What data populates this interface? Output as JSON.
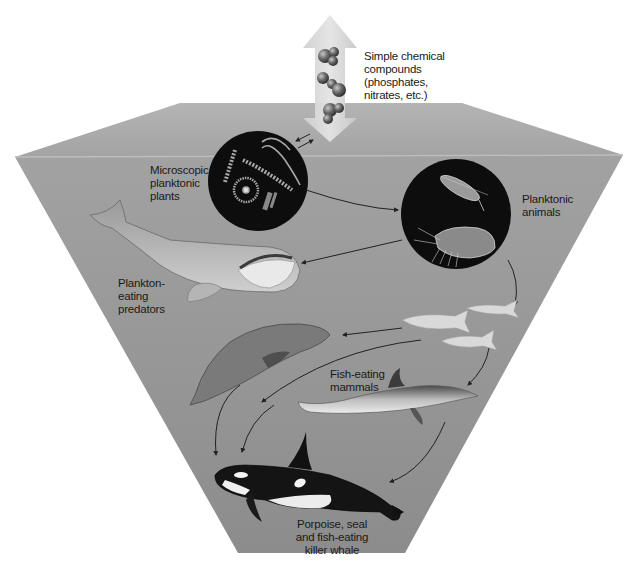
{
  "diagram": {
    "colors": {
      "background": "#ffffff",
      "surface_top": "#a9a9a9",
      "water_face": "#9a9a9a",
      "water_face_dark": "#8a8a8a",
      "circle_fill": "#0d0d0d",
      "arrow_line": "#222222",
      "up_arrow": "#d6d6d6",
      "label_text": "#1a1a1a"
    },
    "labels": {
      "chemicals": [
        "Simple chemical",
        "compounds",
        "(phosphates,",
        "nitrates, etc.)"
      ],
      "plants": [
        "Microscopic",
        "planktonic",
        "plants"
      ],
      "animals": [
        "Planktonic",
        "animals"
      ],
      "predators": [
        "Plankton-",
        "eating",
        "predators"
      ],
      "mammals": [
        "Fish-eating mammals"
      ],
      "killer_whale": [
        "Porpoise, seal",
        "and fish-eating",
        "killer whale"
      ]
    },
    "nodes": [
      {
        "id": "chemicals",
        "name": "Simple chemical compounds (phosphates, nitrates, etc.)"
      },
      {
        "id": "plants",
        "name": "Microscopic planktonic plants"
      },
      {
        "id": "animals",
        "name": "Planktonic animals"
      },
      {
        "id": "baleen_whale",
        "name": "Plankton-eating predators"
      },
      {
        "id": "fish",
        "name": "Fish"
      },
      {
        "id": "seal",
        "name": "Seal"
      },
      {
        "id": "dolphin",
        "name": "Fish-eating mammals"
      },
      {
        "id": "orca",
        "name": "Porpoise, seal and fish-eating killer whale"
      }
    ],
    "edges": [
      {
        "from": "chemicals",
        "to": "plants"
      },
      {
        "from": "plants",
        "to": "animals"
      },
      {
        "from": "animals",
        "to": "baleen_whale"
      },
      {
        "from": "animals",
        "to": "fish"
      },
      {
        "from": "fish",
        "to": "seal"
      },
      {
        "from": "fish",
        "to": "dolphin"
      },
      {
        "from": "seal",
        "to": "orca"
      },
      {
        "from": "dolphin",
        "to": "orca"
      },
      {
        "from": "fish",
        "to": "orca"
      }
    ]
  }
}
